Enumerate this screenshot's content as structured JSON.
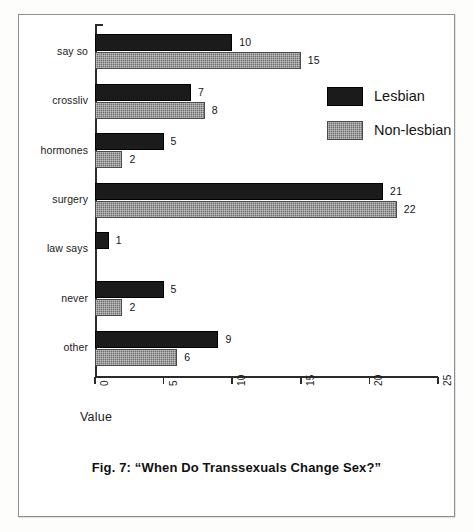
{
  "figure": {
    "caption": "Fig. 7: “When Do Transsexuals Change Sex?”",
    "axis_title": "Value"
  },
  "legend": {
    "position": "top-right",
    "entries": [
      {
        "label": "Lesbian",
        "color": "#1b1b1b",
        "swatch": "solid-black-swatch"
      },
      {
        "label": "Non-lesbian",
        "color": "#6e6e6e",
        "swatch": "dotted-gray-swatch"
      }
    ]
  },
  "chart_data": {
    "type": "bar",
    "orientation": "horizontal",
    "title": "Fig. 7: “When Do Transsexuals Change Sex?”",
    "xlabel": "Value",
    "ylabel": "",
    "xlim": [
      0,
      25
    ],
    "xticks": [
      0,
      5,
      10,
      15,
      20,
      25
    ],
    "xtick_labels": [
      "0",
      "5",
      "10",
      "15",
      "20",
      "25"
    ],
    "xtick_label_rotation": 90,
    "grid": false,
    "legend_position": "top-right",
    "categories": [
      "say so",
      "crossliv",
      "hormones",
      "surgery",
      "law says",
      "never",
      "other"
    ],
    "series": [
      {
        "name": "Lesbian",
        "color": "#1b1b1b",
        "values": [
          10,
          7,
          5,
          21,
          1,
          5,
          9
        ],
        "value_labels": [
          "10",
          "7",
          "5",
          "21",
          "1",
          "5",
          "9"
        ]
      },
      {
        "name": "Non-lesbian",
        "color": "#6e6e6e",
        "values": [
          15,
          8,
          2,
          22,
          0,
          2,
          6
        ],
        "value_labels": [
          "15",
          "8",
          "2",
          "22",
          "",
          "2",
          "6"
        ]
      }
    ]
  }
}
